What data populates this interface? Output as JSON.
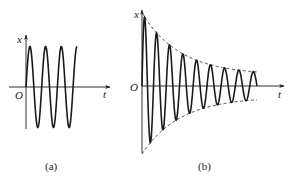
{
  "figure": {
    "panels": [
      {
        "id": "a",
        "caption": "(a)",
        "y_label": "x",
        "x_label": "t",
        "origin_label": "O",
        "description": "Undamped oscillation — constant amplitude sine wave"
      },
      {
        "id": "b",
        "caption": "(b)",
        "y_label": "x",
        "x_label": "t",
        "origin_label": "O",
        "description": "Damped oscillation — amplitude decays within dashed exponential envelope"
      }
    ]
  },
  "chart_data": [
    {
      "type": "line",
      "title": "(a)",
      "xlabel": "t",
      "ylabel": "x",
      "grid": false,
      "series": [
        {
          "name": "x(t) = A sin(ωt)",
          "style": "solid",
          "amplitude": 1.0,
          "cycles": 3.25,
          "damping": 0
        }
      ]
    },
    {
      "type": "line",
      "title": "(b)",
      "xlabel": "t",
      "ylabel": "x",
      "grid": false,
      "series": [
        {
          "name": "x(t) = A e^(-βt) sin(ωt)",
          "style": "solid",
          "amplitude": 1.0,
          "cycles": 8.5,
          "damping": "exponential decay"
        },
        {
          "name": "upper envelope +A e^(-βt)",
          "style": "dashed"
        },
        {
          "name": "lower envelope -A e^(-βt)",
          "style": "dashed"
        }
      ]
    }
  ],
  "colors": {
    "stroke": "#1a1a1a",
    "background": "#ffffff"
  }
}
